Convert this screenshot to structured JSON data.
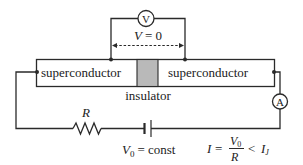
{
  "diagram": {
    "junction": {
      "left_label": "superconductor",
      "right_label": "superconductor",
      "insulator_label": "insulator",
      "insulator_color": "#b9b9b9"
    },
    "voltmeter": {
      "symbol": "V",
      "reading_label_var": "V",
      "reading_label_eq": "= 0"
    },
    "ammeter": {
      "symbol": "A"
    },
    "resistor": {
      "label": "R"
    },
    "battery": {
      "label_var": "V",
      "label_sub": "0",
      "label_rest": "= const"
    },
    "current_formula": {
      "lhs": "I",
      "eq": "=",
      "numerator_var": "V",
      "numerator_sub": "0",
      "denominator": "R",
      "rel": "<",
      "rhs_var": "I",
      "rhs_sub": "J"
    },
    "colors": {
      "line": "#2a2a2a",
      "text": "#222222",
      "insulator": "#b9b9b9",
      "background": "#ffffff"
    }
  }
}
